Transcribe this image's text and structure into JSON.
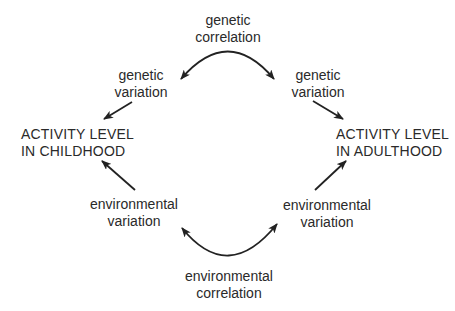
{
  "diagram": {
    "nodes": {
      "childhood": {
        "line1": "ACTIVITY LEVEL",
        "line2": "IN CHILDHOOD"
      },
      "adulthood": {
        "line1": "ACTIVITY LEVEL",
        "line2": "IN ADULTHOOD"
      }
    },
    "labels": {
      "genetic_correlation": {
        "line1": "genetic",
        "line2": "correlation"
      },
      "genetic_variation_left": {
        "line1": "genetic",
        "line2": "variation"
      },
      "genetic_variation_right": {
        "line1": "genetic",
        "line2": "variation"
      },
      "environmental_variation_left": {
        "line1": "environmental",
        "line2": "variation"
      },
      "environmental_variation_right": {
        "line1": "environmental",
        "line2": "variation"
      },
      "environmental_correlation": {
        "line1": "environmental",
        "line2": "correlation"
      }
    },
    "edges": [
      {
        "from": "genetic variation (left)",
        "to": "ACTIVITY LEVEL IN CHILDHOOD"
      },
      {
        "from": "genetic variation (right)",
        "to": "ACTIVITY LEVEL IN ADULTHOOD"
      },
      {
        "from": "environmental variation (left)",
        "to": "ACTIVITY LEVEL IN CHILDHOOD"
      },
      {
        "from": "environmental variation (right)",
        "to": "ACTIVITY LEVEL IN ADULTHOOD"
      },
      {
        "from": "genetic variation (left)",
        "to": "genetic variation (right)",
        "label": "genetic correlation",
        "type": "double-headed-arc"
      },
      {
        "from": "environmental variation (left)",
        "to": "environmental variation (right)",
        "label": "environmental correlation",
        "type": "double-headed-arc"
      }
    ],
    "colors": {
      "text": "#2a2a2a",
      "stroke": "#222222",
      "background": "#ffffff"
    }
  }
}
